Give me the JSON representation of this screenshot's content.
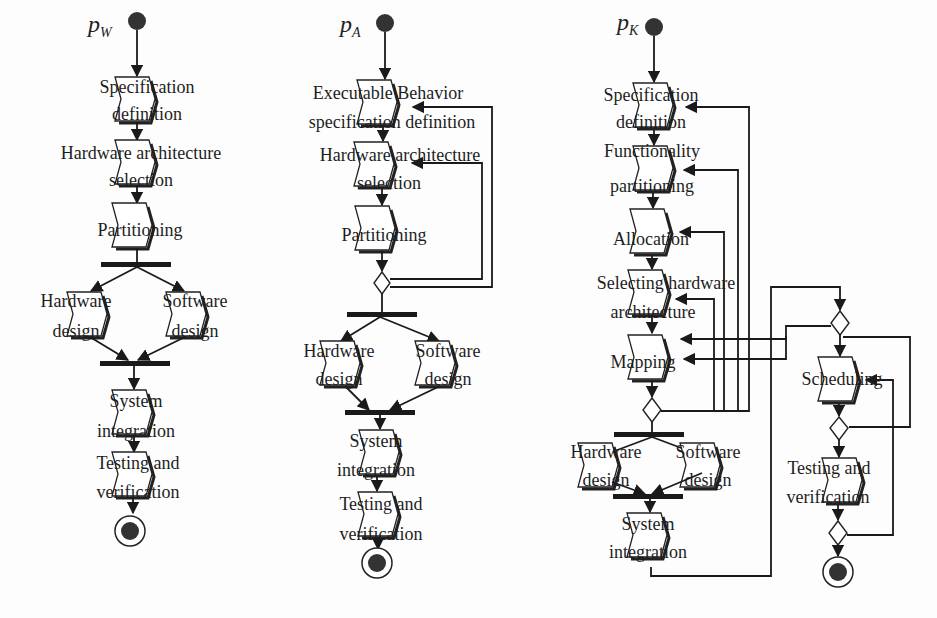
{
  "diagrams": [
    {
      "label": "p",
      "subscript": "W",
      "activities": [
        {
          "line1": "Specification",
          "line2": "definition"
        },
        {
          "line1": "Hardware architecture",
          "line2": "selection"
        },
        {
          "line1": "Partitioning",
          "line2": ""
        },
        {
          "line1": "Hardware",
          "line2": "design"
        },
        {
          "line1": "Software",
          "line2": "design"
        },
        {
          "line1": "System",
          "line2": "integration"
        },
        {
          "line1": "Testing and",
          "line2": "verification"
        }
      ]
    },
    {
      "label": "p",
      "subscript": "A",
      "activities": [
        {
          "line1": "Executable Behavior",
          "line2": "specification definition"
        },
        {
          "line1": "Hardware architecture",
          "line2": "selection"
        },
        {
          "line1": "Partitioning",
          "line2": ""
        },
        {
          "line1": "Hardware",
          "line2": "design"
        },
        {
          "line1": "Software",
          "line2": "design"
        },
        {
          "line1": "System",
          "line2": "integration"
        },
        {
          "line1": "Testing and",
          "line2": "verification"
        }
      ]
    },
    {
      "label": "p",
      "subscript": "K",
      "activities": [
        {
          "line1": "Specification",
          "line2": "definition"
        },
        {
          "line1": "Functionality",
          "line2": "partitioning"
        },
        {
          "line1": "Allocation",
          "line2": ""
        },
        {
          "line1": "Selecting hardware",
          "line2": "architecture"
        },
        {
          "line1": "Mapping",
          "line2": ""
        },
        {
          "line1": "Hardware",
          "line2": "design"
        },
        {
          "line1": "Software",
          "line2": "design"
        },
        {
          "line1": "System",
          "line2": "integration"
        },
        {
          "line1": "Scheduling",
          "line2": ""
        },
        {
          "line1": "Testing and",
          "line2": "verification"
        }
      ]
    }
  ]
}
